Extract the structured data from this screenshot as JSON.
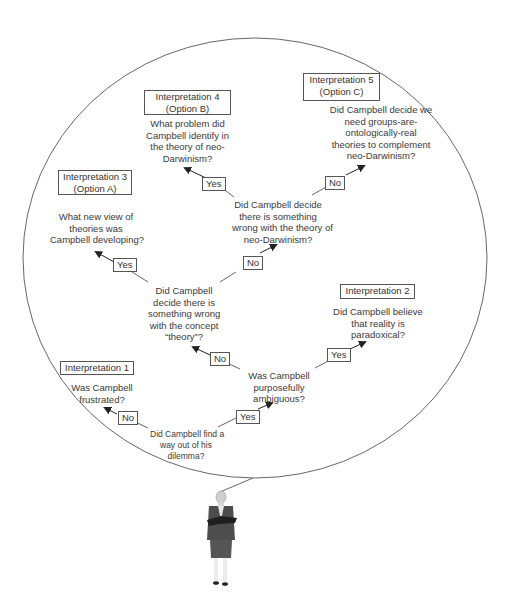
{
  "diagram": {
    "interpretations": [
      {
        "id": 1,
        "title": [
          "Interpretation 1"
        ],
        "question": [
          "Was Campbell",
          "frustrated?"
        ]
      },
      {
        "id": 2,
        "title": [
          "Interpretation 2"
        ],
        "question": [
          "Did Campbell believe",
          "that reality is",
          "paradoxical?"
        ]
      },
      {
        "id": 3,
        "title": [
          "Interpretation 3",
          "(Option A)"
        ],
        "question": [
          "What new view of",
          "theories was",
          "Campbell developing?"
        ]
      },
      {
        "id": 4,
        "title": [
          "Interpretation 4",
          "(Option B)"
        ],
        "question": [
          "What problem did",
          "Campbell identify in",
          "the theory of neo-",
          "Darwinism?"
        ]
      },
      {
        "id": 5,
        "title": [
          "Interpretation 5",
          "(Option C)"
        ],
        "question": [
          "Did Campbell decide we",
          "need groups-are-",
          "ontologically-real",
          "theories to complement",
          "neo-Darwinism?"
        ]
      }
    ],
    "decisions": {
      "root": [
        "Did Campbell find a",
        "way out of his",
        "dilemma?"
      ],
      "ambiguous": [
        "Was Campbell",
        "purposefully",
        "ambiguous?"
      ],
      "concept_theory": [
        "Did Campbell",
        "decide there is",
        "something wrong",
        "with the concept",
        "“theory”?"
      ],
      "neo_darwinism": [
        "Did Campbell decide",
        "there is something",
        "wrong with the theory of",
        "neo-Darwinism?"
      ]
    },
    "edges": {
      "root_no": "No",
      "root_yes": "Yes",
      "ambiguous_no": "No",
      "ambiguous_yes": "Yes",
      "concept_yes": "Yes",
      "concept_no": "No",
      "neo_yes": "Yes",
      "neo_no": "No"
    },
    "colors": {
      "line": "#555555",
      "text": "#333333",
      "suit": "#4a4a4a"
    },
    "figure": "businesswoman-with-folder"
  }
}
